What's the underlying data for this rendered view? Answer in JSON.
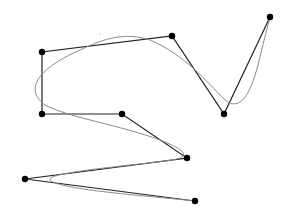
{
  "diagram": {
    "type": "spline-with-control-polygon",
    "background": "#ffffff",
    "control_polygon": {
      "color": "#222222",
      "points": [
        [
          195,
          201
        ],
        [
          25,
          179
        ],
        [
          187,
          158
        ],
        [
          122,
          114
        ],
        [
          42,
          114
        ],
        [
          42,
          52
        ],
        [
          172,
          36
        ],
        [
          224,
          114
        ],
        [
          270,
          17
        ]
      ]
    },
    "curve": {
      "color": "#8a8a8a",
      "path": "M 195 201 C 150 196, 60 190, 50 180 C 45 172, 140 165, 172 160 C 195 156, 180 148, 160 140 C 120 125, 70 118, 45 105 C 25 90, 35 70, 80 50 C 105 38, 125 32, 150 40 C 185 55, 205 80, 225 100 C 240 112, 250 95, 258 65 C 264 40, 268 25, 270 17"
    },
    "stray_mark": [
      100,
      34
    ],
    "node_radius": 3.2,
    "node_color": "#000000"
  }
}
